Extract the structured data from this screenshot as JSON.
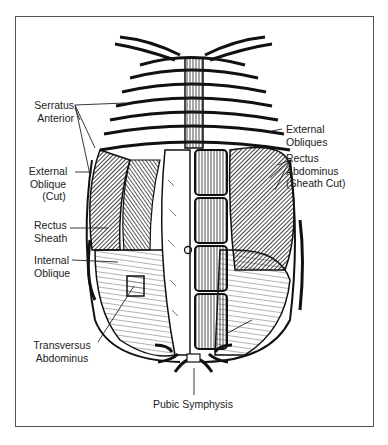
{
  "figure": {
    "labels": {
      "serratus_anterior": [
        "Serratus",
        "Anterior"
      ],
      "external_oblique_cut": [
        "External",
        "Oblique",
        "(Cut)"
      ],
      "rectus_sheath": [
        "Rectus",
        "Sheath"
      ],
      "internal_oblique": [
        "Internal",
        "Oblique"
      ],
      "transversus_abdominus": [
        "Transversus",
        "Abdominus"
      ],
      "external_obliques": [
        "External",
        "Obliques"
      ],
      "rectus_abdominus": [
        "Rectus",
        "Abdominus",
        "(Sheath Cut)"
      ],
      "pubic_symphysis": [
        "Pubic Symphysis"
      ]
    }
  }
}
